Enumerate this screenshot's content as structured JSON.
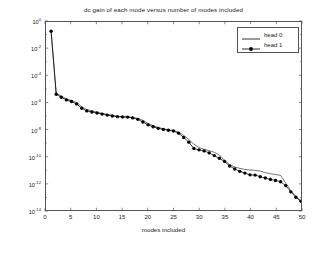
{
  "chart_data": {
    "type": "line",
    "title": "dc gain of each mode versus number of modes included",
    "xlabel": "modes included",
    "ylabel": "sorted dc value",
    "yscale": "log",
    "xlim": [
      0,
      50
    ],
    "ylim": [
      1e-14,
      1
    ],
    "grid": false,
    "xticks": [
      0,
      5,
      10,
      15,
      20,
      25,
      30,
      35,
      40,
      45,
      50
    ],
    "xtick_labels": [
      "0",
      "5",
      "10",
      "15",
      "20",
      "25",
      "30",
      "35",
      "40",
      "45",
      "50"
    ],
    "ytick_exponents": [
      0,
      -2,
      -4,
      -6,
      -8,
      -10,
      -12,
      -14
    ],
    "ytick_labels": [
      "10^0",
      "10^-2",
      "10^-4",
      "10^-6",
      "10^-8",
      "10^-10",
      "10^-12",
      "10^-14"
    ],
    "legend_position": "upper right",
    "x": [
      1,
      2,
      3,
      4,
      5,
      6,
      7,
      8,
      9,
      10,
      11,
      12,
      13,
      14,
      15,
      16,
      17,
      18,
      19,
      20,
      21,
      22,
      23,
      24,
      25,
      26,
      27,
      28,
      29,
      30,
      31,
      32,
      33,
      34,
      35,
      36,
      37,
      38,
      39,
      40,
      41,
      42,
      43,
      44,
      45,
      46,
      47,
      48,
      49,
      50
    ],
    "series": [
      {
        "name": "head 0",
        "marker": "none",
        "line": "solid",
        "color": "#000000",
        "log10_values": [
          -0.68,
          -5.3,
          -5.52,
          -5.72,
          -5.85,
          -6.0,
          -6.3,
          -6.52,
          -6.62,
          -6.72,
          -6.8,
          -6.88,
          -6.95,
          -7.02,
          -7.05,
          -7.06,
          -7.1,
          -7.18,
          -7.32,
          -7.55,
          -7.72,
          -7.85,
          -7.95,
          -8.02,
          -8.08,
          -8.2,
          -8.45,
          -8.75,
          -9.1,
          -9.35,
          -9.48,
          -9.58,
          -9.7,
          -9.9,
          -10.3,
          -10.62,
          -10.8,
          -10.9,
          -10.98,
          -11.02,
          -11.05,
          -11.1,
          -11.22,
          -11.3,
          -11.36,
          -11.42,
          -12.0,
          -12.55,
          -13.0,
          -13.35
        ]
      },
      {
        "name": "head 1",
        "marker": "dot",
        "line": "solid",
        "color": "#000000",
        "log10_values": [
          -0.68,
          -5.38,
          -5.6,
          -5.8,
          -5.92,
          -6.1,
          -6.42,
          -6.62,
          -6.7,
          -6.78,
          -6.86,
          -6.93,
          -7.0,
          -7.05,
          -7.07,
          -7.08,
          -7.14,
          -7.25,
          -7.45,
          -7.66,
          -7.8,
          -7.92,
          -8.0,
          -8.06,
          -8.12,
          -8.28,
          -8.6,
          -8.95,
          -9.42,
          -9.52,
          -9.6,
          -9.75,
          -9.95,
          -10.15,
          -10.38,
          -10.72,
          -10.95,
          -11.12,
          -11.25,
          -11.38,
          -11.4,
          -11.52,
          -11.62,
          -11.72,
          -11.8,
          -11.9,
          -12.18,
          -12.65,
          -13.05,
          -13.35
        ]
      }
    ]
  },
  "legend": {
    "items": [
      {
        "label": "head 0"
      },
      {
        "label": "head 1"
      }
    ]
  }
}
